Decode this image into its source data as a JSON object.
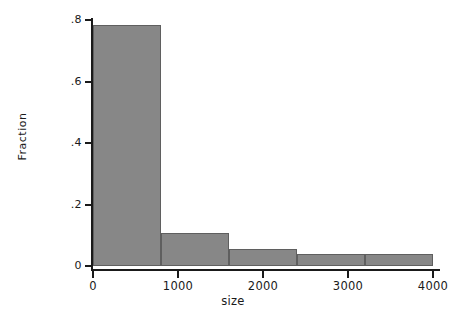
{
  "chart_data": {
    "type": "bar",
    "title": "",
    "subtitle": "",
    "xlabel": "size",
    "ylabel": "Fraction",
    "categories": [
      "0-800",
      "800-1600",
      "1600-2400",
      "2400-3200",
      "3200-4000"
    ],
    "bin_edges": [
      0,
      800,
      1600,
      2400,
      3200,
      4000
    ],
    "values": [
      0.784,
      0.107,
      0.055,
      0.039,
      0.039
    ],
    "xlim": [
      0,
      4000
    ],
    "ylim": [
      0,
      0.8
    ],
    "xticks": [
      0,
      1000,
      2000,
      3000,
      4000
    ],
    "xtick_labels": [
      "0",
      "1000",
      "2000",
      "3000",
      "4000"
    ],
    "yticks": [
      0,
      0.2,
      0.4,
      0.6,
      0.8
    ],
    "ytick_labels": [
      "0",
      ".2",
      ".4",
      ".6",
      ".8"
    ],
    "grid": false,
    "legend": false,
    "legend_position": "none",
    "bar_fill_color": "#878787",
    "bar_edge_color": "#5f5f5f",
    "axis_color": "#1a1a1a",
    "background_color": "#ffffff"
  }
}
